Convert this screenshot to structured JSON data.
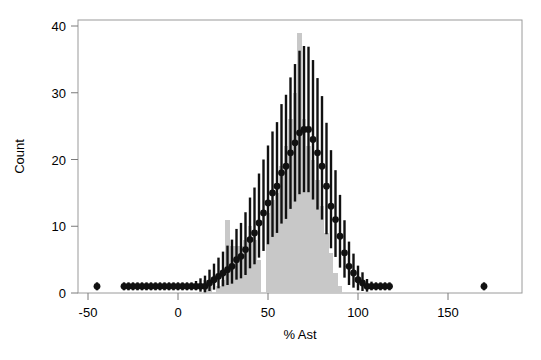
{
  "chart_data": {
    "type": "bar",
    "title": "",
    "subtitle": "",
    "xlabel": "% Ast",
    "ylabel": "Count",
    "xlim": [
      -60,
      180
    ],
    "ylim": [
      0,
      41
    ],
    "xticks": [
      -50,
      0,
      50,
      100,
      150
    ],
    "xtick_labels": [
      "-50",
      "0",
      "50",
      "100",
      "150"
    ],
    "yticks": [
      0,
      10,
      20,
      30,
      40
    ],
    "ytick_labels": [
      "0",
      "10",
      "20",
      "30",
      "40"
    ],
    "grid": false,
    "legend": "none",
    "colors": {
      "histogram_fill": "#c8c8c8",
      "point": "#111111",
      "errorbar": "#111111",
      "axis": "#9a9a9a",
      "background": "#ffffff"
    },
    "series": [
      {
        "name": "Observed histogram",
        "type": "bar",
        "bin_width": 2.5,
        "x": [
          15.0,
          17.5,
          20.0,
          22.5,
          25.0,
          27.5,
          30.0,
          32.5,
          35.0,
          37.5,
          40.0,
          42.5,
          45.0,
          47.5,
          50.0,
          52.5,
          55.0,
          57.5,
          60.0,
          62.5,
          65.0,
          67.5,
          70.0,
          72.5,
          75.0,
          77.5,
          80.0,
          82.5,
          85.0,
          87.5,
          90.0
        ],
        "values": [
          2,
          1,
          0,
          1,
          2,
          11,
          7,
          7,
          7,
          8,
          10,
          8,
          5,
          0,
          12,
          14,
          15,
          19,
          22,
          26,
          30,
          39,
          26,
          22,
          20,
          17,
          13,
          9,
          6,
          3,
          1
        ]
      },
      {
        "name": "Model prediction",
        "type": "scatter-errorbar",
        "x": [
          -45,
          -30,
          -27.5,
          -25,
          -22.5,
          -20,
          -17.5,
          -15,
          -12.5,
          -10,
          -7.5,
          -5,
          -2.5,
          0,
          2.5,
          5,
          7.5,
          10,
          12.5,
          15,
          17.5,
          20,
          22.5,
          25,
          27.5,
          30,
          32.5,
          35,
          37.5,
          40,
          42.5,
          45,
          47.5,
          50,
          52.5,
          55,
          57.5,
          60,
          62.5,
          65,
          67.5,
          70,
          72.5,
          75,
          77.5,
          80,
          82.5,
          85,
          87.5,
          90,
          92.5,
          95,
          97.5,
          100,
          102.5,
          105,
          107.5,
          110,
          112.5,
          115,
          117.5,
          170
        ],
        "values": [
          1,
          1,
          1,
          1,
          1,
          1,
          1,
          1,
          1,
          1,
          1,
          1,
          1,
          1,
          1,
          1,
          1,
          1,
          1,
          1,
          1.5,
          2,
          2.5,
          3,
          3.5,
          4,
          5,
          5.5,
          6.5,
          8,
          9,
          10.5,
          12,
          13.5,
          15,
          16,
          18,
          19,
          21,
          22.5,
          24,
          24.5,
          24.5,
          23,
          21,
          19,
          16,
          13,
          11,
          8.5,
          6,
          4,
          3,
          2,
          1.5,
          1,
          1,
          1,
          1,
          1,
          1,
          1
        ],
        "yerr_low": [
          0.6,
          0.6,
          0.6,
          0.6,
          0.6,
          0.6,
          0.6,
          0.6,
          0.6,
          0.6,
          0.6,
          0.6,
          0.6,
          0.6,
          0.6,
          0.6,
          0.6,
          0.6,
          0.8,
          0.9,
          1.2,
          1.5,
          1.8,
          2.0,
          2.3,
          2.6,
          3.0,
          3.3,
          3.8,
          4.3,
          4.7,
          5.2,
          5.7,
          6.2,
          6.6,
          7.0,
          7.6,
          7.9,
          8.4,
          8.8,
          9.2,
          9.4,
          9.4,
          9.0,
          8.5,
          8.0,
          7.2,
          6.3,
          5.6,
          4.7,
          3.7,
          2.8,
          2.2,
          1.6,
          1.2,
          0.8,
          0.6,
          0.6,
          0.6,
          0.6,
          0.6,
          0.6
        ],
        "yerr_high": [
          0.6,
          0.6,
          0.6,
          0.6,
          0.6,
          0.6,
          0.6,
          0.6,
          0.6,
          0.6,
          0.6,
          0.6,
          0.6,
          0.6,
          0.6,
          0.6,
          0.6,
          0.8,
          1.2,
          1.6,
          2.0,
          2.4,
          2.8,
          3.2,
          3.6,
          4.0,
          4.6,
          5.0,
          5.6,
          6.3,
          6.8,
          7.4,
          8.0,
          8.6,
          9.2,
          9.6,
          10.3,
          10.7,
          11.3,
          11.8,
          12.3,
          12.5,
          12.4,
          11.9,
          11.2,
          10.5,
          9.5,
          8.4,
          7.4,
          6.2,
          4.9,
          3.7,
          2.9,
          2.1,
          1.6,
          1.1,
          0.7,
          0.6,
          0.6,
          0.6,
          0.6,
          0.6
        ]
      }
    ]
  },
  "axes": {
    "x_title": "% Ast",
    "y_title": "Count"
  }
}
